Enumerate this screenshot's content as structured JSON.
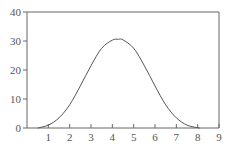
{
  "chart_data": {
    "type": "line",
    "title": "",
    "xlabel": "",
    "ylabel": "",
    "xlim": [
      0,
      9
    ],
    "ylim": [
      0,
      40
    ],
    "grid": false,
    "legend": null,
    "x_ticks": [
      "1",
      "2",
      "3",
      "4",
      "5",
      "6",
      "7",
      "8",
      "9"
    ],
    "y_ticks": [
      "0",
      "10",
      "20",
      "30",
      "40"
    ],
    "series": [
      {
        "name": "curve",
        "color": "#555555",
        "x": [
          0.5,
          1.0,
          1.5,
          2.0,
          2.5,
          3.0,
          3.5,
          4.0,
          4.3,
          4.5,
          5.0,
          5.5,
          6.0,
          6.5,
          7.0,
          7.5,
          8.0,
          8.1
        ],
        "y": [
          0.0,
          1.0,
          3.5,
          8.0,
          14.5,
          21.5,
          27.5,
          30.3,
          30.6,
          30.4,
          27.5,
          21.5,
          14.5,
          8.0,
          3.5,
          1.0,
          0.1,
          0.0
        ]
      }
    ]
  },
  "colors": {
    "axis": "#666666",
    "line": "#555555",
    "text": "#555555"
  }
}
